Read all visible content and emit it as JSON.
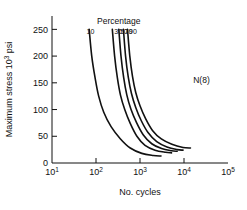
{
  "chart_data": {
    "type": "line",
    "title": "",
    "xlabel": "No. cycles",
    "ylabel": "Maximum stress 10³ psi",
    "ylabel_main": "Maximum stress 10",
    "ylabel_exp": "3",
    "ylabel_unit": "psi",
    "xscale": "log",
    "yscale": "linear",
    "xlim": [
      10,
      100000
    ],
    "ylim": [
      0,
      275
    ],
    "grid": false,
    "legend_position": "top-inside",
    "legend_title": "Percentage",
    "annotation": "N(8)",
    "annotation_x": 25000,
    "annotation_y": 150,
    "ytick_labels": [
      "0",
      "50",
      "100",
      "150",
      "200",
      "250"
    ],
    "ytick_values": [
      0,
      50,
      100,
      150,
      200,
      250
    ],
    "xtick_labels": [
      "10¹",
      "10²",
      "10³",
      "10⁴",
      "10⁵"
    ],
    "xtick_mantissa": [
      "10",
      "10",
      "10",
      "10",
      "10"
    ],
    "xtick_exponents": [
      "1",
      "2",
      "3",
      "4",
      "5"
    ],
    "xtick_values": [
      10,
      100,
      1000,
      10000,
      100000
    ],
    "series": [
      {
        "name": "10",
        "label": "10",
        "label_x": 75,
        "label_y": 34,
        "points": [
          [
            70,
            250
          ],
          [
            80,
            200
          ],
          [
            95,
            160
          ],
          [
            115,
            125
          ],
          [
            150,
            95
          ],
          [
            220,
            68
          ],
          [
            360,
            45
          ],
          [
            600,
            28
          ],
          [
            1100,
            18
          ],
          [
            2000,
            14
          ],
          [
            3000,
            13
          ]
        ]
      },
      {
        "name": "30",
        "label": "30",
        "label_x": 320,
        "label_y": 34,
        "points": [
          [
            235,
            250
          ],
          [
            265,
            200
          ],
          [
            305,
            160
          ],
          [
            360,
            127
          ],
          [
            450,
            100
          ],
          [
            600,
            74
          ],
          [
            850,
            50
          ],
          [
            1300,
            33
          ],
          [
            2200,
            24
          ],
          [
            3800,
            20
          ],
          [
            5200,
            19
          ]
        ]
      },
      {
        "name": "50",
        "label": "50",
        "label_x": 430,
        "label_y": 34,
        "points": [
          [
            330,
            250
          ],
          [
            370,
            200
          ],
          [
            425,
            160
          ],
          [
            500,
            128
          ],
          [
            620,
            101
          ],
          [
            830,
            76
          ],
          [
            1180,
            53
          ],
          [
            1850,
            36
          ],
          [
            3100,
            27
          ],
          [
            5200,
            23
          ],
          [
            7000,
            22
          ]
        ]
      },
      {
        "name": "70",
        "label": "70",
        "label_x": 545,
        "label_y": 34,
        "points": [
          [
            420,
            250
          ],
          [
            470,
            200
          ],
          [
            540,
            161
          ],
          [
            640,
            130
          ],
          [
            800,
            104
          ],
          [
            1070,
            79
          ],
          [
            1520,
            57
          ],
          [
            2400,
            40
          ],
          [
            4100,
            30
          ],
          [
            7000,
            25
          ],
          [
            9500,
            24
          ]
        ]
      },
      {
        "name": "90",
        "label": "90",
        "label_x": 690,
        "label_y": 34,
        "points": [
          [
            520,
            250
          ],
          [
            585,
            201
          ],
          [
            675,
            162
          ],
          [
            800,
            132
          ],
          [
            1000,
            107
          ],
          [
            1340,
            83
          ],
          [
            1920,
            61
          ],
          [
            3050,
            45
          ],
          [
            5300,
            35
          ],
          [
            9500,
            29
          ],
          [
            14000,
            28
          ]
        ]
      }
    ]
  }
}
